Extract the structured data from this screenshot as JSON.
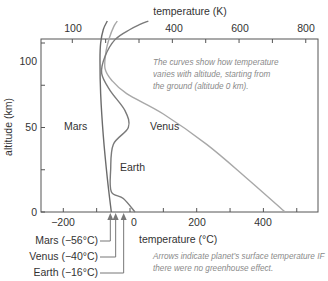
{
  "chart_data": {
    "type": "line",
    "title": "",
    "top_axis": {
      "label": "temperature (K)",
      "ticks": [
        100,
        400,
        600,
        800
      ],
      "minor_ticks_K": [
        100,
        200,
        300,
        400,
        500,
        600,
        700,
        800
      ]
    },
    "xlabel": "temperature (°C)",
    "ylabel": "altitude (km)",
    "xlim": [
      -266,
      564
    ],
    "ylim": [
      0,
      113
    ],
    "x_ticks": [
      -200,
      0,
      200,
      400
    ],
    "x_minor_ticks": [
      -200,
      -100,
      0,
      100,
      200,
      300,
      400,
      500
    ],
    "y_ticks": [
      0,
      50,
      100
    ],
    "y_minor_ticks": [
      0,
      25,
      50,
      75,
      100
    ],
    "grid": false,
    "series": [
      {
        "name": "Mars",
        "color": "#6b6b6b",
        "points": [
          [
            -56,
            0
          ],
          [
            -68,
            20
          ],
          [
            -80,
            45
          ],
          [
            -88,
            70
          ],
          [
            -90,
            90
          ],
          [
            -88,
            100
          ],
          [
            -80,
            108
          ],
          [
            -68,
            113
          ]
        ]
      },
      {
        "name": "Venus",
        "color": "#a8a8a8",
        "points": [
          [
            465,
            0
          ],
          [
            350,
            20
          ],
          [
            230,
            40
          ],
          [
            100,
            58
          ],
          [
            -10,
            70
          ],
          [
            -55,
            78
          ],
          [
            -75,
            85
          ],
          [
            -72,
            95
          ],
          [
            -62,
            103
          ],
          [
            -48,
            110
          ],
          [
            -38,
            113
          ]
        ]
      },
      {
        "name": "Earth",
        "color": "#7a7a7a",
        "points": [
          [
            15,
            0
          ],
          [
            -20,
            8
          ],
          [
            -56,
            12
          ],
          [
            -58,
            25
          ],
          [
            -50,
            40
          ],
          [
            -5,
            50
          ],
          [
            -15,
            60
          ],
          [
            -60,
            72
          ],
          [
            -85,
            82
          ],
          [
            -75,
            92
          ],
          [
            -45,
            102
          ],
          [
            0,
            108
          ],
          [
            30,
            111
          ],
          [
            55,
            113
          ]
        ]
      }
    ],
    "series_labels": [
      {
        "name": "Mars",
        "x": -123,
        "y": 54
      },
      {
        "name": "Venus",
        "x": 47,
        "y": 54
      },
      {
        "name": "Earth",
        "x": -40,
        "y": 30
      }
    ],
    "no_greenhouse_arrows": [
      {
        "label": "Mars (−56°C)",
        "value": -56
      },
      {
        "label": "Venus (−40°C)",
        "value": -40
      },
      {
        "label": "Earth (−16°C)",
        "value": -16
      }
    ],
    "annotations": [
      "The curves show how temperature varies with altitude, starting from the ground (altitude 0 km).",
      "Arrows indicate planet’s surface temperature IF there were no greenhouse effect."
    ]
  },
  "text": {
    "top_axis_title": "temperature (K)",
    "bottom_axis_title": "temperature (°C)",
    "y_axis_title": "altitude (km)",
    "note_top_lines": [
      "The curves show how temperature",
      "varies with altitude, starting from",
      "the ground (altitude 0 km)."
    ],
    "note_bottom_lines": [
      "Arrows indicate planet’s surface temperature IF",
      "there were no greenhouse effect."
    ],
    "mars_label": "Mars",
    "venus_label": "Venus",
    "earth_label": "Earth",
    "arrow_labels": [
      "Mars (−56°C)",
      "Venus (−40°C)",
      "Earth (−16°C)"
    ],
    "top_tick_labels": [
      "100",
      "400",
      "600",
      "800"
    ],
    "bottom_tick_labels": [
      "−200",
      "0",
      "200",
      "400"
    ],
    "y_tick_labels": [
      "0",
      "50",
      "100"
    ]
  }
}
